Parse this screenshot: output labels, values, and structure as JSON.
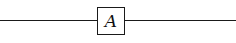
{
  "diagram": {
    "type": "block-diagram",
    "blocks": [
      {
        "id": "A",
        "label": "A"
      }
    ],
    "connections": [
      {
        "from": "input",
        "to": "A"
      },
      {
        "from": "A",
        "to": "output"
      }
    ],
    "colors": {
      "stroke": "#1a1a1a",
      "background": "#ffffff"
    }
  }
}
